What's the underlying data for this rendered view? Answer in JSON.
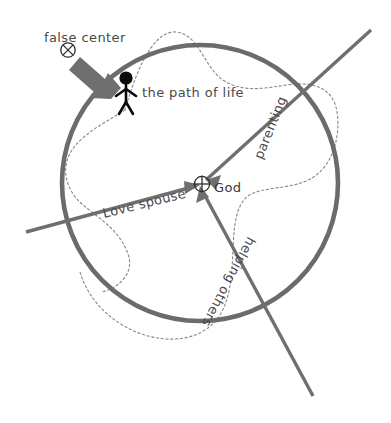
{
  "diagram": {
    "title": "the path of life",
    "background_color": "#ffffff",
    "labels": {
      "false_center": "false center",
      "path_of_life": "the path of life",
      "god": "God",
      "parenting": "parenting",
      "love_spouse": "Love spouse",
      "helping_others": "helping others"
    },
    "symbols": {
      "false_center_glyph": "circled-x",
      "god_glyph": "circled-plus",
      "person_glyph": "stick-figure"
    },
    "colors": {
      "circle_stroke": "#6b6b6b",
      "axis_stroke": "#6f6f6f",
      "dotted_path": "#8a8a8a",
      "text": "#4a4a4a",
      "figure": "#0a0a0a"
    },
    "geometry": {
      "circle_center_x": 200,
      "circle_center_y": 183,
      "circle_radius": 138
    }
  }
}
